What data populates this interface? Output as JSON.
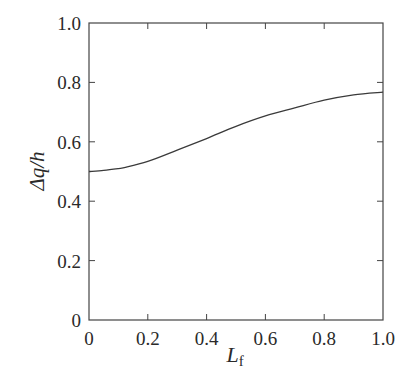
{
  "chart_data": {
    "type": "line",
    "title": "",
    "xlabel": "L",
    "xlabel_subscript": "f",
    "ylabel": "Δq/h",
    "xlim": [
      0,
      1.0
    ],
    "ylim": [
      0,
      1.0
    ],
    "xticks": [
      0,
      0.2,
      0.4,
      0.6,
      0.8,
      1.0
    ],
    "xtick_labels": [
      "0",
      "0.2",
      "0.4",
      "0.6",
      "0.8",
      "1.0"
    ],
    "yticks": [
      0,
      0.2,
      0.4,
      0.6,
      0.8,
      1.0
    ],
    "ytick_labels": [
      "0",
      "0.2",
      "0.4",
      "0.6",
      "0.8",
      "1.0"
    ],
    "grid": false,
    "legend": null,
    "series": [
      {
        "name": "Δq/h",
        "x": [
          0.0,
          0.05,
          0.1,
          0.12,
          0.2,
          0.3,
          0.4,
          0.5,
          0.6,
          0.7,
          0.8,
          0.9,
          1.0
        ],
        "values": [
          0.5,
          0.504,
          0.51,
          0.513,
          0.534,
          0.572,
          0.611,
          0.652,
          0.687,
          0.714,
          0.74,
          0.758,
          0.767
        ]
      }
    ]
  },
  "style": {
    "axis_color": "#444444",
    "line_color": "#3a3a3a",
    "text_color": "#2a2a2a"
  }
}
